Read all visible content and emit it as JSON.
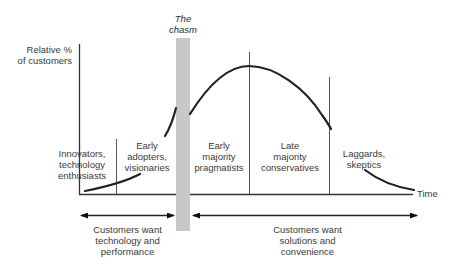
{
  "diagram": {
    "y_axis_label": "Relative %\nof customers",
    "x_axis_label": "Time",
    "chasm_label": "The\nchasm",
    "segments": [
      {
        "id": "innovators",
        "label": "Innovators,\ntechnology\nenthusiasts"
      },
      {
        "id": "early-adopters",
        "label": "Early\nadopters,\nvisionaries"
      },
      {
        "id": "early-majority",
        "label": "Early\nmajority\npragmatists"
      },
      {
        "id": "late-majority",
        "label": "Late\nmajority\nconservatives"
      },
      {
        "id": "laggards",
        "label": "Laggards,\nskeptics"
      }
    ],
    "bottom_groups": [
      {
        "id": "technology",
        "label": "Customers want\ntechnology and\nperformance"
      },
      {
        "id": "solutions",
        "label": "Customers want\nsolutions and\nconvenience"
      }
    ],
    "colors": {
      "curve": "#222222",
      "axis": "#333333",
      "divider": "#555555",
      "chasm_band": "#c8c8c8",
      "text": "#3a3a3a"
    }
  }
}
